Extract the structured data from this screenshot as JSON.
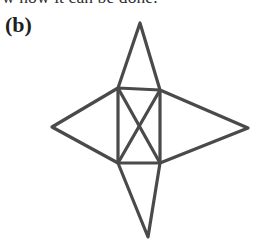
{
  "page": {
    "width": 256,
    "height": 247,
    "background_color": "#ffffff"
  },
  "running_text": {
    "text": "w how it can be done.",
    "note_clipped": "bottom half of line visible at top edge",
    "color": "#2f2f2f"
  },
  "figure": {
    "label": "(b)",
    "label_color": "#1f1f1f",
    "stroke_color": "#4a4a4a",
    "stroke_width": 3.2,
    "geometry": {
      "square": {
        "top_left": [
          118,
          88
        ],
        "top_right": [
          160,
          90
        ],
        "bottom_right": [
          160,
          163
        ],
        "bottom_left": [
          118,
          163
        ]
      },
      "star_points": {
        "top": [
          140,
          23
        ],
        "right": [
          248,
          128
        ],
        "bottom": [
          148,
          237
        ],
        "left": [
          52,
          127
        ]
      },
      "diagonal_crossing": [
        140,
        126
      ]
    },
    "segments": [
      {
        "name": "square-edge-top",
        "from": [
          118,
          88
        ],
        "to": [
          160,
          90
        ]
      },
      {
        "name": "square-edge-right",
        "from": [
          160,
          90
        ],
        "to": [
          160,
          163
        ]
      },
      {
        "name": "square-edge-bottom",
        "from": [
          160,
          163
        ],
        "to": [
          118,
          163
        ]
      },
      {
        "name": "square-edge-left",
        "from": [
          118,
          163
        ],
        "to": [
          118,
          88
        ]
      },
      {
        "name": "diagonal-tl-br",
        "from": [
          118,
          88
        ],
        "to": [
          160,
          163
        ]
      },
      {
        "name": "diagonal-tr-bl",
        "from": [
          160,
          90
        ],
        "to": [
          118,
          163
        ]
      },
      {
        "name": "top-triangle-left-edge",
        "from": [
          118,
          88
        ],
        "to": [
          140,
          23
        ]
      },
      {
        "name": "top-triangle-right-edge",
        "from": [
          140,
          23
        ],
        "to": [
          160,
          90
        ]
      },
      {
        "name": "right-triangle-top-edge",
        "from": [
          160,
          90
        ],
        "to": [
          248,
          128
        ]
      },
      {
        "name": "right-triangle-bottom-edge",
        "from": [
          248,
          128
        ],
        "to": [
          160,
          163
        ]
      },
      {
        "name": "bottom-triangle-right-edge",
        "from": [
          160,
          163
        ],
        "to": [
          148,
          237
        ]
      },
      {
        "name": "bottom-triangle-left-edge",
        "from": [
          148,
          237
        ],
        "to": [
          118,
          163
        ]
      },
      {
        "name": "left-triangle-bottom-edge",
        "from": [
          118,
          163
        ],
        "to": [
          52,
          127
        ]
      },
      {
        "name": "left-triangle-top-edge",
        "from": [
          52,
          127
        ],
        "to": [
          118,
          88
        ]
      }
    ]
  }
}
